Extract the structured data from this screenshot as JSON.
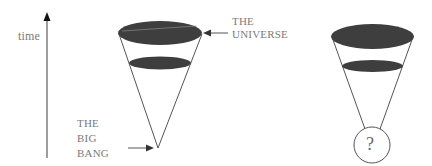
{
  "labels": {
    "time": "time",
    "universe_line1": "THE",
    "universe_line2": "UNIVERSE",
    "bigbang_line1": "THE",
    "bigbang_line2": "BIG",
    "bigbang_line3": "BANG",
    "question": "?"
  },
  "colors": {
    "ellipse_fill": "#3e3e3e",
    "line": "#5a5a5a",
    "text": "#7a7a7a",
    "background": "#ffffff"
  },
  "figures": [
    {
      "name": "big-bang-cone",
      "apex": "point"
    },
    {
      "name": "unknown-origin-cone",
      "apex": "circle-with-question-mark"
    }
  ]
}
